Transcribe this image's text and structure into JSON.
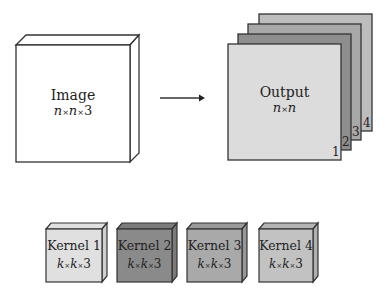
{
  "input": {
    "title": "Image",
    "dims": [
      "n",
      "n",
      "3"
    ],
    "fill": "#ffffff"
  },
  "output": {
    "title": "Output",
    "dims": [
      "n",
      "n"
    ],
    "channels": [
      {
        "index": "1",
        "fill": "#dcdcdc"
      },
      {
        "index": "2",
        "fill": "#8e8e8e"
      },
      {
        "index": "3",
        "fill": "#a8a8a8"
      },
      {
        "index": "4",
        "fill": "#bdbdbd"
      }
    ]
  },
  "arrow": {
    "direction": "right"
  },
  "kernels": [
    {
      "title": "Kernel 1",
      "dims": [
        "k",
        "k",
        "3"
      ],
      "fill": "#e0e0e0"
    },
    {
      "title": "Kernel 2",
      "dims": [
        "k",
        "k",
        "3"
      ],
      "fill": "#8a8a8a"
    },
    {
      "title": "Kernel 3",
      "dims": [
        "k",
        "k",
        "3"
      ],
      "fill": "#a9a9a9"
    },
    {
      "title": "Kernel 4",
      "dims": [
        "k",
        "k",
        "3"
      ],
      "fill": "#c2c2c2"
    }
  ],
  "symbols": {
    "times": "×"
  }
}
